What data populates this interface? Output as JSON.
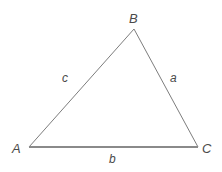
{
  "diagram": {
    "kind": "triangle-diagram",
    "background_color": "#ffffff",
    "stroke_color_sides": "#7d7d7d",
    "stroke_color_base": "#8a8a8a",
    "label_color": "#4a4a4a",
    "vertices": [
      {
        "name": "A",
        "label": "A",
        "x": 29,
        "y": 147
      },
      {
        "name": "B",
        "label": "B",
        "x": 134,
        "y": 29
      },
      {
        "name": "C",
        "label": "C",
        "x": 198,
        "y": 147
      }
    ],
    "sides": [
      {
        "name": "a",
        "label": "a",
        "from": "B",
        "to": "C",
        "opposite_vertex": "A"
      },
      {
        "name": "b",
        "label": "b",
        "from": "A",
        "to": "C",
        "opposite_vertex": "B"
      },
      {
        "name": "c",
        "label": "c",
        "from": "A",
        "to": "B",
        "opposite_vertex": "C"
      }
    ]
  }
}
